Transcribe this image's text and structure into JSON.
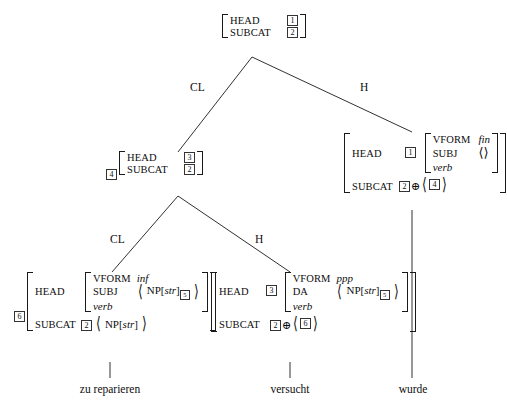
{
  "figure": {
    "type": "hpsg-syntax-tree",
    "sentence": "zu reparieren versucht wurde",
    "ink_color": "#1a1a1a"
  },
  "nodes": {
    "root": {
      "attrs": [
        "HEAD",
        "SUBCAT"
      ],
      "head_tag": "1",
      "subcat_tag": "2"
    },
    "mid_left": {
      "outer_tag": "4",
      "attrs": [
        "HEAD",
        "SUBCAT"
      ],
      "head_tag": "3",
      "subcat_tag": "2"
    },
    "mid_right": {
      "head_attr": "HEAD",
      "head_tag": "1",
      "vform_attr": "VFORM",
      "vform_value": "fin",
      "subj_attr": "SUBJ",
      "subj_value": "⟨⟩",
      "type": "verb",
      "subcat_attr": "SUBCAT",
      "subcat_tag": "2",
      "oplus": "⊕",
      "subcat_list_tag": "4"
    },
    "leaf_left": {
      "outer_tag": "6",
      "head_attr": "HEAD",
      "vform_attr": "VFORM",
      "vform_value": "inf",
      "subj_attr": "SUBJ",
      "subj_np": "NP[",
      "subj_np_case": "str",
      "subj_np_close": "]",
      "subj_np_tag": "5",
      "type": "verb",
      "subcat_attr": "SUBCAT",
      "subcat_tag": "2",
      "subcat_np": "NP[",
      "subcat_np_case": "str",
      "subcat_np_close": "]"
    },
    "leaf_right": {
      "head_attr": "HEAD",
      "head_tag": "3",
      "vform_attr": "VFORM",
      "vform_value": "ppp",
      "da_attr": "DA",
      "da_np": "NP[",
      "da_np_case": "str",
      "da_np_close": "]",
      "da_np_tag": "5",
      "type": "verb",
      "subcat_attr": "SUBCAT",
      "subcat_tag": "2",
      "oplus": "⊕",
      "subcat_list_tag": "6"
    }
  },
  "edges": {
    "top_left_label": "CL",
    "top_right_label": "H",
    "mid_left_label": "CL",
    "mid_right_label": "H"
  },
  "terminals": [
    {
      "text": "zu reparieren"
    },
    {
      "text": "versucht"
    },
    {
      "text": "wurde"
    }
  ]
}
